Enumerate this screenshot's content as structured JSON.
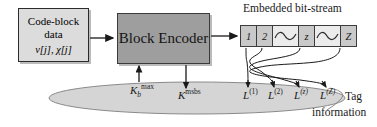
{
  "diagram": {
    "code_block": {
      "line1": "Code-block",
      "line2": "data",
      "line3": "v[j], χ[j]"
    },
    "encoder": {
      "label": "Block Encoder"
    },
    "bitstream": {
      "title": "Embedded bit-stream",
      "cells": [
        {
          "label": "1",
          "type": "index"
        },
        {
          "label": "2",
          "type": "index"
        },
        {
          "label": "∼",
          "type": "wave"
        },
        {
          "label": "z",
          "type": "index"
        },
        {
          "label": "∼",
          "type": "wave"
        },
        {
          "label": "Z",
          "type": "index"
        }
      ]
    },
    "labels": {
      "kb_max": {
        "base": "K",
        "sub": "b",
        "sup": "max"
      },
      "k_msbs": {
        "base": "K",
        "sup": "msbs"
      },
      "l_1": {
        "base": "L",
        "sup": "(1)"
      },
      "l_2": {
        "base": "L",
        "sup": "(2)"
      },
      "l_z": {
        "base": "L",
        "sup": "(z)"
      },
      "l_Z": {
        "base": "L",
        "sup": "(Z)"
      },
      "tag": "Tag",
      "information": "information"
    },
    "colors": {
      "code_block_fill": "#dcdcdc",
      "encoder_fill": "#9e9e9e",
      "cell_fill": "#c9c9c9",
      "wave_cell_fill": "#ececec",
      "ellipse_fill": "#d5d5d5",
      "stroke": "#2b2b2b"
    }
  }
}
